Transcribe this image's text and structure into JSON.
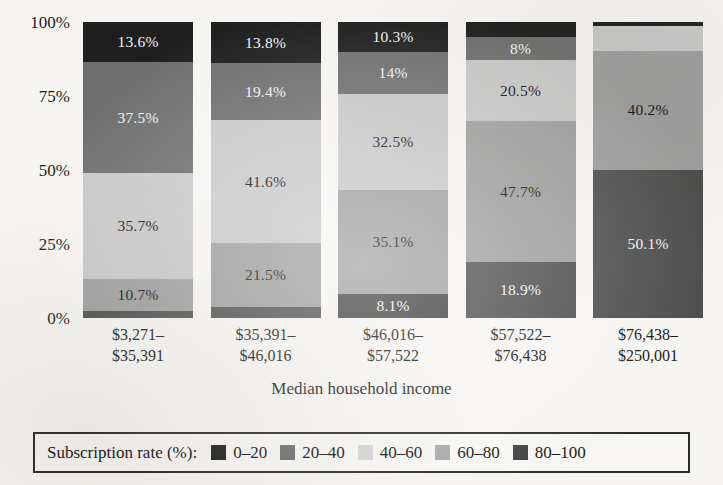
{
  "chart_data": {
    "type": "bar",
    "subtype": "stacked-100-percent",
    "title": "",
    "xlabel": "Median household income",
    "ylabel": "",
    "ylim": [
      0,
      100
    ],
    "grid": false,
    "legend_position": "bottom",
    "legend_title": "Subscription rate (%):",
    "categories": [
      "$3,271–$35,391",
      "$35,391–$46,016",
      "$46,016–$57,522",
      "$57,522–$76,438",
      "$76,438–$250,001"
    ],
    "series": [
      {
        "name": "0–20",
        "color": "#1c1c1c",
        "values": [
          2.5,
          3.7,
          8.1,
          4.9,
          0.3
        ]
      },
      {
        "name": "20–40",
        "color": "#616161",
        "values": [
          10.7,
          21.5,
          35.1,
          18.9,
          0.0
        ]
      },
      {
        "name": "40–60",
        "color": "#cfcfcf",
        "values": [
          35.7,
          41.6,
          32.5,
          47.7,
          9.4
        ]
      },
      {
        "name": "60–80",
        "color": "#a8a8a8",
        "values": [
          37.5,
          19.4,
          14.0,
          20.5,
          40.2
        ]
      },
      {
        "name": "80–100",
        "color": "#4a4a4a",
        "values": [
          13.6,
          13.8,
          10.3,
          8.0,
          50.1
        ]
      }
    ],
    "y_ticks": [
      "0%",
      "25%",
      "50%",
      "75%",
      "100%"
    ],
    "y_tick_values": [
      0,
      25,
      50,
      75,
      100
    ]
  },
  "axes": {
    "y_ticks": [
      {
        "label": "100%",
        "value": 100
      },
      {
        "label": "75%",
        "value": 75
      },
      {
        "label": "50%",
        "value": 50
      },
      {
        "label": "25%",
        "value": 25
      },
      {
        "label": "0%",
        "value": 0
      }
    ],
    "x_title": "Median household income",
    "x_ticks": [
      {
        "line1": "$3,271–",
        "line2": "$35,391"
      },
      {
        "line1": "$35,391–",
        "line2": "$46,016"
      },
      {
        "line1": "$46,016–",
        "line2": "$57,522"
      },
      {
        "line1": "$57,522–",
        "line2": "$76,438"
      },
      {
        "line1": "$76,438–",
        "line2": "$250,001"
      }
    ]
  },
  "bars": [
    {
      "category": "$3,271–$35,391",
      "segments": [
        {
          "series": "80–100",
          "value": 13.6,
          "label": "13.6%",
          "color": "#1f1f1f",
          "label_color": "light",
          "show_label": true
        },
        {
          "series": "60–80",
          "value": 37.5,
          "label": "37.5%",
          "color": "#6e6e6e",
          "label_color": "light",
          "show_label": true
        },
        {
          "series": "40–60",
          "value": 35.7,
          "label": "35.7%",
          "color": "#c8c8c8",
          "label_color": "dark",
          "show_label": true
        },
        {
          "series": "20–40",
          "value": 10.7,
          "label": "10.7%",
          "color": "#9d9d9d",
          "label_color": "dark",
          "show_label": true
        },
        {
          "series": "0–20",
          "value": 2.5,
          "label": "",
          "color": "#4d4d4d",
          "label_color": "light",
          "show_label": false
        }
      ]
    },
    {
      "category": "$35,391–$46,016",
      "segments": [
        {
          "series": "80–100",
          "value": 13.8,
          "label": "13.8%",
          "color": "#1f1f1f",
          "label_color": "light",
          "show_label": true
        },
        {
          "series": "60–80",
          "value": 19.4,
          "label": "19.4%",
          "color": "#6e6e6e",
          "label_color": "light",
          "show_label": true
        },
        {
          "series": "40–60",
          "value": 41.6,
          "label": "41.6%",
          "color": "#c8c8c8",
          "label_color": "dark",
          "show_label": true
        },
        {
          "series": "20–40",
          "value": 21.5,
          "label": "21.5%",
          "color": "#9d9d9d",
          "label_color": "dark",
          "show_label": true
        },
        {
          "series": "0–20",
          "value": 3.7,
          "label": "",
          "color": "#4d4d4d",
          "label_color": "light",
          "show_label": false
        }
      ]
    },
    {
      "category": "$46,016–$57,522",
      "segments": [
        {
          "series": "80–100",
          "value": 10.3,
          "label": "10.3%",
          "color": "#1f1f1f",
          "label_color": "light",
          "show_label": true
        },
        {
          "series": "60–80",
          "value": 14.0,
          "label": "14%",
          "color": "#6e6e6e",
          "label_color": "light",
          "show_label": true
        },
        {
          "series": "40–60",
          "value": 32.5,
          "label": "32.5%",
          "color": "#c8c8c8",
          "label_color": "dark",
          "show_label": true
        },
        {
          "series": "20–40",
          "value": 35.1,
          "label": "35.1%",
          "color": "#9d9d9d",
          "label_color": "dark",
          "show_label": true
        },
        {
          "series": "0–20",
          "value": 8.1,
          "label": "8.1%",
          "color": "#3c3c3c",
          "label_color": "light",
          "show_label": true
        }
      ]
    },
    {
      "category": "$57,522–$76,438",
      "segments": [
        {
          "series": "80–100",
          "value": 4.9,
          "label": "",
          "color": "#1f1f1f",
          "label_color": "light",
          "show_label": false
        },
        {
          "series": "60–80",
          "value": 8.0,
          "label": "8%",
          "color": "#6e6e6e",
          "label_color": "light",
          "show_label": true
        },
        {
          "series": "40–60",
          "value": 20.5,
          "label": "20.5%",
          "color": "#c8c8c8",
          "label_color": "dark",
          "show_label": true
        },
        {
          "series": "20–40",
          "value": 47.7,
          "label": "47.7%",
          "color": "#9d9d9d",
          "label_color": "dark",
          "show_label": true
        },
        {
          "series": "0–20",
          "value": 18.9,
          "label": "18.9%",
          "color": "#4d4d4d",
          "label_color": "light",
          "show_label": true
        }
      ]
    },
    {
      "category": "$76,438–$250,001",
      "segments": [
        {
          "series": "80–100",
          "value": 1.3,
          "label": "",
          "color": "#1f1f1f",
          "label_color": "light",
          "show_label": false
        },
        {
          "series": "60–80",
          "value": 8.4,
          "label": "",
          "color": "#c8c8c8",
          "label_color": "dark",
          "show_label": false
        },
        {
          "series": "40–60",
          "value": 40.2,
          "label": "40.2%",
          "color": "#9d9d9d",
          "label_color": "dark",
          "show_label": true
        },
        {
          "series": "20–40",
          "value": 50.1,
          "label": "50.1%",
          "color": "#4d4d4d",
          "label_color": "light",
          "show_label": true
        }
      ]
    }
  ],
  "legend": {
    "title": "Subscription rate (%):",
    "items": [
      {
        "label": "0–20",
        "color": "#1f1f1f"
      },
      {
        "label": "20–40",
        "color": "#6e6e6e"
      },
      {
        "label": "40–60",
        "color": "#d5d5d5"
      },
      {
        "label": "60–80",
        "color": "#a8a8a8"
      },
      {
        "label": "80–100",
        "color": "#3f3f3f"
      }
    ]
  },
  "colors": {
    "background": "#f7f5f2",
    "text": "#141414",
    "legend_border": "#2b2b2b"
  }
}
